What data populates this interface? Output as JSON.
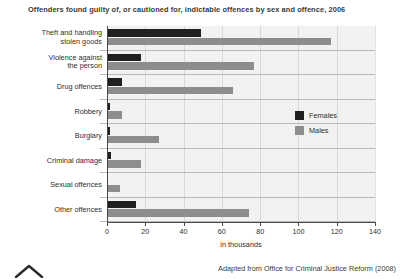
{
  "chart_data": {
    "type": "bar",
    "orientation": "horizontal",
    "title": "Offenders found guilty of, or cautioned for, indictable offences by sex and offence, 2006",
    "xlabel": "in thousands",
    "ylabel": "",
    "xlim": [
      0,
      140
    ],
    "xticks": [
      0,
      20,
      40,
      60,
      80,
      100,
      120,
      140
    ],
    "xtick_labels": [
      "0",
      "20",
      "40",
      "60",
      "80",
      "100",
      "120",
      "140"
    ],
    "grid": true,
    "legend_position": "right",
    "categories": [
      "Theft and handling\nstolen goods",
      "Violence against\nthe person",
      "Drug offences",
      "Robbery",
      "Burglary",
      "Criminal damage",
      "Sexual offences",
      "Other offences"
    ],
    "series": [
      {
        "name": "Females",
        "color": "#221f20",
        "values": [
          49,
          18,
          8,
          1.5,
          1.5,
          2,
          0.3,
          15
        ]
      },
      {
        "name": "Males",
        "color": "#8d8d8d",
        "values": [
          117,
          77,
          66,
          8,
          27,
          18,
          7,
          74
        ]
      }
    ]
  },
  "source": {
    "text": "Adapted from Office for Criminal Justice Reform (2008)"
  }
}
